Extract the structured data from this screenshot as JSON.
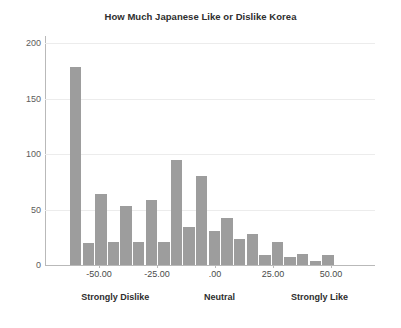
{
  "chart_data": {
    "type": "bar",
    "title": "How Much Japanese Like or Dislike Korea",
    "xlabel": "",
    "ylabel": "",
    "ylim": [
      0,
      200
    ],
    "xlim": [
      -62.5,
      62.5
    ],
    "grid": true,
    "legend": null,
    "bar_color": "#9d9d9d",
    "y_ticks": [
      "0",
      "50",
      "100",
      "150",
      "200"
    ],
    "y_tick_values": [
      0,
      50,
      100,
      150,
      200
    ],
    "x_ticks": [
      "-50.00",
      "-25.00",
      ".00",
      "25.00",
      "50.00"
    ],
    "x_tick_values": [
      -50,
      -25,
      0,
      25,
      50
    ],
    "annotations": [
      {
        "text": "Strongly Dislike",
        "x": -43
      },
      {
        "text": "Neutral",
        "x": 2
      },
      {
        "text": "Strongly Like",
        "x": 45
      }
    ],
    "bin_width": 5,
    "x": [
      -57.5,
      -52.5,
      -47.5,
      -42.5,
      -37.5,
      -32.5,
      -27.5,
      -22.5,
      -17.5,
      -12.5,
      -7.5,
      -2.5,
      2.5,
      7.5,
      12.5,
      17.5,
      22.5,
      27.5,
      32.5,
      37.5,
      42.5,
      47.5,
      52.5
    ],
    "values": [
      178,
      20,
      64,
      21,
      53,
      21,
      59,
      21,
      95,
      34,
      80,
      31,
      42,
      23,
      28,
      9,
      21,
      7,
      10,
      4,
      9,
      0,
      0
    ],
    "categories": [
      "-57.5",
      "-52.5",
      "-47.5",
      "-42.5",
      "-37.5",
      "-32.5",
      "-27.5",
      "-22.5",
      "-17.5",
      "-12.5",
      "-7.5",
      "-2.5",
      "2.5",
      "7.5",
      "12.5",
      "17.5",
      "22.5",
      "27.5",
      "32.5",
      "37.5",
      "42.5",
      "47.5",
      "52.5"
    ]
  }
}
